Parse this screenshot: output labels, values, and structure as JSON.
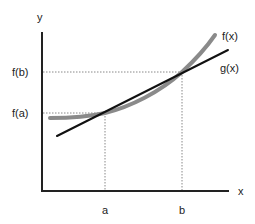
{
  "diagram": {
    "axes": {
      "x_label": "x",
      "y_label": "y"
    },
    "ticks": {
      "x": [
        {
          "label": "a"
        },
        {
          "label": "b"
        }
      ],
      "y": [
        {
          "label": "f(b)"
        },
        {
          "label": "f(a)"
        }
      ]
    },
    "curves": [
      {
        "name": "f(x)",
        "label": "f(x)",
        "style": "thick gray curve",
        "color": "#8a8a8a"
      },
      {
        "name": "g(x)",
        "label": "g(x)",
        "style": "black straight line (secant)",
        "color": "#111111"
      }
    ],
    "guides": "dotted lines from a to f(a) and from b to f(b)",
    "colors": {
      "axis": "#222222",
      "f_curve": "#8a8a8a",
      "g_line": "#111111",
      "guide": "#888888"
    }
  }
}
